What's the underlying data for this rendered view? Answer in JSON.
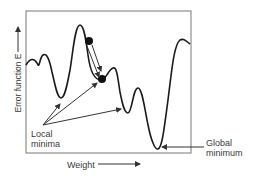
{
  "diagram": {
    "x_axis_label": "Weight",
    "y_axis_label": "Error function E",
    "annotations": {
      "local_minima": [
        "Local",
        "minima"
      ],
      "global_minimum": [
        "Global",
        "minimum"
      ]
    },
    "colors": {
      "curve": "#1a1a1a",
      "frame": "#555555",
      "ball": "#111111",
      "arrow": "#333333"
    },
    "elements": {
      "balls": 2,
      "local_minima_arrows": 3,
      "global_minimum_arrow": 1
    }
  }
}
